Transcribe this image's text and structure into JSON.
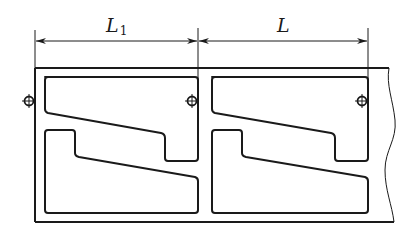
{
  "diagram": {
    "title": "",
    "dimensions": [
      {
        "id": "L1",
        "label_main": "L",
        "label_sub": "1",
        "from_x": 35,
        "to_x": 198
      },
      {
        "id": "L",
        "label_main": "L",
        "label_sub": "",
        "from_x": 198,
        "to_x": 368
      }
    ],
    "components": {
      "frame": "strip with repeating nested part layout, broken (wavy) right edge",
      "units": 2,
      "pilot_holes": 3
    },
    "colors": {
      "stroke": "#1a1a1a",
      "background": "#ffffff"
    }
  }
}
